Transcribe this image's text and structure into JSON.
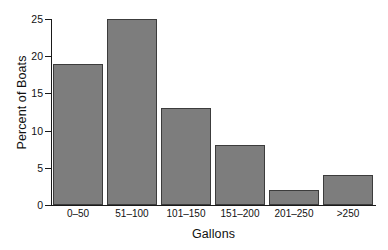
{
  "chart_data": {
    "type": "bar",
    "title": "",
    "subtitle": "",
    "xlabel": "Gallons",
    "ylabel": "Percent of Boats",
    "categories": [
      "0–50",
      "51–100",
      "101–150",
      "151–200",
      "201–250",
      ">250"
    ],
    "values": [
      19,
      25,
      13,
      8,
      2,
      4
    ],
    "ylim": [
      0,
      25
    ],
    "yticks": [
      0,
      5,
      10,
      15,
      20,
      25
    ],
    "ytick_labels": [
      "0",
      "5",
      "10",
      "15",
      "20",
      "25"
    ],
    "grid": false,
    "legend": false,
    "legend_position": "none",
    "orientation": "vertical",
    "bar_color": "#7d7d7d",
    "bar_edge_color": "#3c3c3c",
    "background_color": "#ffffff",
    "axis_color": "#1a1a1a"
  },
  "axes": {
    "y_title": "Percent of Boats",
    "x_title": "Gallons"
  },
  "bars": [
    {
      "label": "0–50",
      "value": 19,
      "value_text": "19"
    },
    {
      "label": "51–100",
      "value": 25,
      "value_text": "25"
    },
    {
      "label": "101–150",
      "value": 13,
      "value_text": "13"
    },
    {
      "label": "151–200",
      "value": 8,
      "value_text": "8"
    },
    {
      "label": "201–250",
      "value": 2,
      "value_text": "2"
    },
    {
      "label": ">250",
      "value": 4,
      "value_text": "4"
    }
  ],
  "yticks": [
    {
      "value": 25,
      "label": "25"
    },
    {
      "value": 20,
      "label": "20"
    },
    {
      "value": 15,
      "label": "15"
    },
    {
      "value": 10,
      "label": "10"
    },
    {
      "value": 5,
      "label": "5"
    },
    {
      "value": 0,
      "label": "0"
    }
  ]
}
